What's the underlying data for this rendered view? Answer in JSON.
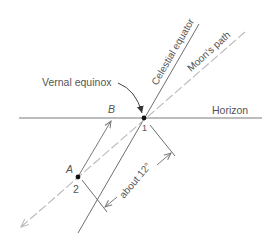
{
  "diagram": {
    "labels": {
      "celestial_equator": "Celestial equator",
      "moons_path": "Moon's path",
      "vernal_equinox": "Vernal equinox",
      "horizon": "Horizon",
      "point_a": "A",
      "point_b": "B",
      "point_1": "1",
      "point_2": "2",
      "angle": "about 12°"
    },
    "colors": {
      "line": "#6e6e6e",
      "dashed": "#b5b5b5",
      "text": "#555555",
      "point": "#111111"
    }
  }
}
